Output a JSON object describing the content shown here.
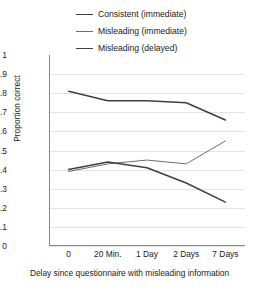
{
  "chart_data": {
    "type": "line",
    "title": "",
    "xlabel": "Delay since questionnaire with misleading information",
    "ylabel": "Proportion correct",
    "categories": [
      "0",
      "20 Min.",
      "1 Day",
      "2 Days",
      "7 Days"
    ],
    "yticks": [
      "1",
      "0.9",
      "0.8",
      "0.7",
      "0.6",
      "0.5",
      "0.4",
      "0.3",
      "0.2",
      "0.1",
      "0"
    ],
    "ylim": [
      0,
      1
    ],
    "grid": true,
    "legend_position": "top-center",
    "series": [
      {
        "name": "Consistent (immediate)",
        "color": "#404040",
        "values": [
          0.81,
          0.76,
          0.76,
          0.75,
          0.66
        ]
      },
      {
        "name": "Misleading (immediate)",
        "color": "#6e6e6e",
        "values": [
          0.39,
          0.43,
          0.45,
          0.43,
          0.55
        ]
      },
      {
        "name": "Misleading (delayed)",
        "color": "#404040",
        "values": [
          0.4,
          0.44,
          0.41,
          0.33,
          0.23
        ]
      }
    ]
  }
}
